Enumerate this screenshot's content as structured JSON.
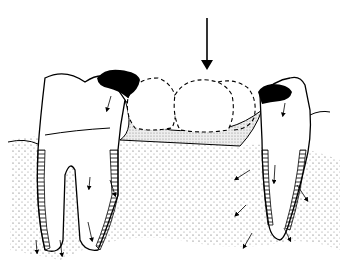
{
  "diagram": {
    "background_color": "#ffffff",
    "line_color": "#000000",
    "elements": {
      "load_arrow": {
        "label": "occlusal force arrow",
        "x": 207,
        "y_start": 18,
        "y_end": 68
      },
      "abutment_left": {
        "label": "left abutment tooth (two roots)"
      },
      "abutment_right": {
        "label": "right abutment tooth (single root)"
      },
      "pontics": {
        "label": "pontic crowns (dashed outline)",
        "count": 2
      },
      "connector": {
        "label": "bridge connector (stippled)"
      },
      "retainers": {
        "label": "retainer attachments (black)",
        "count": 2
      },
      "bone": {
        "label": "alveolar bone (stippled)"
      },
      "force_arrows": {
        "label": "stress distribution arrows"
      }
    }
  }
}
